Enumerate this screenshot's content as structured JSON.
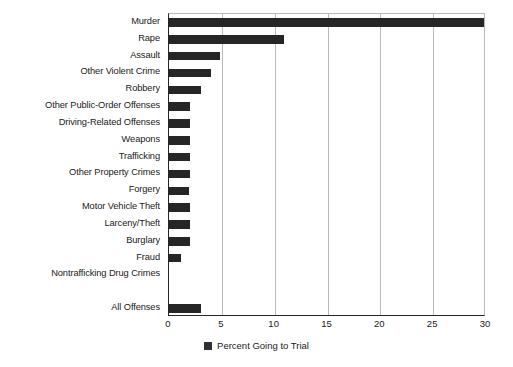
{
  "chart_data": {
    "type": "bar",
    "orientation": "horizontal",
    "title": "",
    "xlabel": "",
    "ylabel": "",
    "xlim": [
      0,
      30
    ],
    "xticks": [
      0,
      5,
      10,
      15,
      20,
      25,
      30
    ],
    "grid": "vertical",
    "legend": {
      "position": "bottom-center",
      "entries": [
        {
          "label": "Percent Going to Trial",
          "color": "#303030"
        }
      ]
    },
    "series_name": "Percent Going to Trial",
    "bar_color": "#262626",
    "categories": [
      "Murder",
      "Rape",
      "Assault",
      "Other Violent Crime",
      "Robbery",
      "Other Public-Order Offenses",
      "Driving-Related Offenses",
      "Weapons",
      "Trafficking",
      "Other Property Crimes",
      "Forgery",
      "Motor Vehicle Theft",
      "Larceny/Theft",
      "Burglary",
      "Fraud",
      "Nontrafficking Drug Crimes",
      "All Offenses"
    ],
    "values": [
      29.8,
      10.9,
      4.8,
      4.0,
      3.0,
      2.0,
      2.0,
      2.0,
      2.0,
      2.0,
      1.9,
      2.0,
      2.0,
      2.0,
      1.1,
      0.0,
      3.0
    ]
  }
}
